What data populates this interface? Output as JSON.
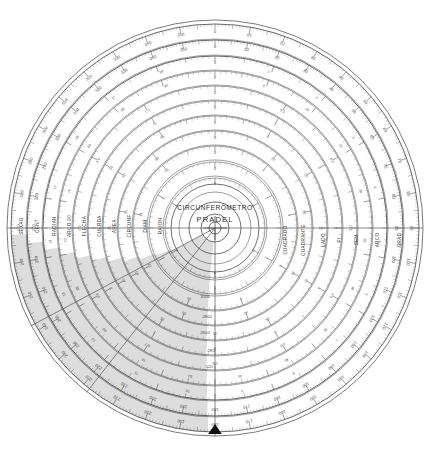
{
  "document": {
    "kind": "circular-slide-rule",
    "brand_line_1": "CIRCUNFERÔMETRO",
    "brand_line_2": "PRADEL",
    "background_color": "#ffffff",
    "ink_color": "#5a5a5a",
    "shade_color": "#000000",
    "center_x": 215,
    "center_y": 228,
    "outer_radius": 208
  },
  "index_pointer": {
    "name": "index-pointer",
    "position": "left",
    "angle_deg": 180,
    "color": "#111111"
  },
  "scale_labels_left": [
    {
      "text": "SEXAG",
      "radius": 196
    },
    {
      "text": "CENT",
      "radius": 180
    },
    {
      "text": "RADIAN",
      "radius": 163
    },
    {
      "text": "ARCO 90",
      "radius": 148
    },
    {
      "text": "FLECHA",
      "radius": 133
    },
    {
      "text": "CUERDA",
      "radius": 118
    },
    {
      "text": "AREA",
      "radius": 103
    },
    {
      "text": "CIRCUNF",
      "radius": 88
    },
    {
      "text": "DIAM",
      "radius": 72
    },
    {
      "text": "RAION",
      "radius": 57
    }
  ],
  "scale_labels_right": [
    {
      "text": "CUADRADO",
      "radius": 78
    },
    {
      "text": "CUADRANTE",
      "radius": 96
    },
    {
      "text": "LADO",
      "radius": 116
    },
    {
      "text": "PI",
      "radius": 132
    },
    {
      "text": "SEN",
      "radius": 149
    },
    {
      "text": "ARCO",
      "radius": 170
    },
    {
      "text": "GRAD",
      "radius": 192
    }
  ],
  "rings": [
    {
      "name": "ring-sexagesimal",
      "radius": 204,
      "minor_step_deg": 1,
      "mid_step_deg": 5,
      "major_step_deg": 10,
      "label_step_deg": 10,
      "label_radius": 196,
      "labels": [
        "0",
        "10",
        "20",
        "30",
        "40",
        "50",
        "60",
        "70",
        "80",
        "90",
        "100",
        "110",
        "120",
        "130",
        "140",
        "150",
        "160",
        "170",
        "180",
        "190",
        "200",
        "210",
        "220",
        "230",
        "240",
        "250",
        "260",
        "270",
        "280",
        "290",
        "300",
        "310",
        "320",
        "330",
        "340",
        "350"
      ]
    },
    {
      "name": "ring-centesimal",
      "radius": 188,
      "minor_step_deg": 1,
      "mid_step_deg": 5,
      "major_step_deg": 10,
      "label_step_deg": 10,
      "label_radius": 181,
      "labels": [
        "0",
        "10",
        "20",
        "30",
        "40",
        "50",
        "60",
        "70",
        "80",
        "90",
        "100",
        "110",
        "120",
        "130",
        "140",
        "150",
        "160",
        "170",
        "180",
        "190",
        "200",
        "210",
        "220",
        "230",
        "240",
        "250",
        "260",
        "270",
        "280",
        "290",
        "300",
        "310",
        "320",
        "330",
        "340",
        "350"
      ]
    },
    {
      "name": "ring-radian",
      "radius": 172,
      "minor_step_deg": 2,
      "mid_step_deg": 10,
      "major_step_deg": 20,
      "label_step_deg": 20,
      "label_radius": 165,
      "labels": [
        "0",
        "1",
        "2",
        "3",
        "4",
        "5",
        "6",
        "7",
        "8",
        "9",
        "10",
        "11",
        "12",
        "13",
        "14",
        "15",
        "16",
        "17",
        "18"
      ]
    },
    {
      "name": "ring-arco90",
      "radius": 157,
      "minor_step_deg": 2,
      "mid_step_deg": 10,
      "major_step_deg": 20,
      "label_step_deg": 20,
      "label_radius": 150,
      "labels": [
        "0",
        "5",
        "10",
        "15",
        "20",
        "25",
        "30",
        "35",
        "40",
        "45",
        "50",
        "55",
        "60",
        "65",
        "70",
        "75",
        "80",
        "85",
        "90"
      ]
    },
    {
      "name": "ring-flecha",
      "radius": 142,
      "minor_step_deg": 3,
      "mid_step_deg": 15,
      "major_step_deg": 30,
      "label_step_deg": 30,
      "label_radius": 135,
      "labels": [
        "0",
        "0.1",
        "0.2",
        "0.3",
        "0.4",
        "0.5",
        "0.6",
        "0.7",
        "0.8",
        "0.9",
        "1.0",
        "1.1"
      ]
    },
    {
      "name": "ring-cuerda",
      "radius": 127,
      "minor_step_deg": 3,
      "mid_step_deg": 15,
      "major_step_deg": 30,
      "label_step_deg": 30,
      "label_radius": 120,
      "labels": [
        "0",
        "1",
        "2",
        "3",
        "4",
        "5",
        "6",
        "7",
        "8",
        "9",
        "10",
        "11"
      ]
    },
    {
      "name": "ring-area",
      "radius": 112,
      "minor_step_deg": 3,
      "mid_step_deg": 15,
      "major_step_deg": 30,
      "label_step_deg": 30,
      "label_radius": 105,
      "labels": [
        "0",
        "5",
        "10",
        "15",
        "20",
        "25",
        "30",
        "35",
        "40",
        "45",
        "50",
        "55"
      ]
    },
    {
      "name": "ring-circunf",
      "radius": 97,
      "minor_step_deg": 4,
      "mid_step_deg": 20,
      "major_step_deg": 40,
      "label_step_deg": 40,
      "label_radius": 90,
      "labels": [
        "0",
        "10",
        "20",
        "30",
        "40",
        "50",
        "60",
        "70",
        "80"
      ]
    },
    {
      "name": "ring-diam",
      "radius": 82,
      "minor_step_deg": 4,
      "mid_step_deg": 20,
      "major_step_deg": 40,
      "label_step_deg": 40,
      "label_radius": 75,
      "labels": [
        "0",
        "2",
        "4",
        "6",
        "8",
        "10",
        "12",
        "14",
        "16"
      ]
    },
    {
      "name": "ring-raion",
      "radius": 66,
      "minor_step_deg": 5,
      "mid_step_deg": 30,
      "major_step_deg": 60,
      "label_step_deg": 60,
      "label_radius": 59,
      "labels": [
        "0",
        "1",
        "2",
        "3",
        "4",
        "5"
      ]
    },
    {
      "name": "ring-inner",
      "radius": 50,
      "minor_step_deg": 6,
      "mid_step_deg": 30,
      "major_step_deg": 60,
      "label_step_deg": 60,
      "label_radius": 44,
      "labels": [
        "0",
        "1",
        "2",
        "3",
        "4",
        "5"
      ]
    }
  ],
  "lower_numeric_labels": [
    {
      "text": "3000",
      "x": 205,
      "y": 298
    },
    {
      "text": "2800",
      "x": 207,
      "y": 318
    },
    {
      "text": "2600",
      "x": 205,
      "y": 334
    },
    {
      "text": "285",
      "x": 211,
      "y": 352
    },
    {
      "text": "520",
      "x": 209,
      "y": 368
    }
  ],
  "hub": {
    "name": "center-hub",
    "radii": [
      44,
      26,
      14,
      6
    ],
    "crosshair": true
  },
  "shade_overlay": {
    "name": "cursor-shade-region",
    "description": "translucent grey stepped wedge over lower-left quadrant",
    "opacity": 0.135,
    "start_angle_deg": 182,
    "end_angle_deg": 268
  }
}
